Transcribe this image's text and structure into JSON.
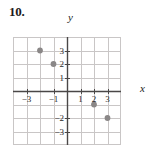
{
  "figure": {
    "problem_number": "10.",
    "x_axis_name": "x",
    "y_axis_name": "y"
  },
  "chart_data": {
    "type": "scatter",
    "title": "10.",
    "xlabel": "x",
    "ylabel": "y",
    "xlim": [
      -4,
      4
    ],
    "ylim": [
      -4,
      4
    ],
    "grid": true,
    "legend": null,
    "axis_color": "#4a4747",
    "grid_color": "#c9c6c6",
    "point_color": "#8a8787",
    "x_ticks": [
      -3,
      -1,
      1,
      2,
      3
    ],
    "x_tick_labels": [
      "-3",
      "-1",
      "1",
      "2",
      "3"
    ],
    "y_ticks": [
      3,
      2,
      1,
      -2,
      -3
    ],
    "y_tick_labels": [
      "3",
      "2",
      "1",
      "-2",
      "-3"
    ],
    "points": [
      {
        "x": -2,
        "y": 3,
        "label": "(-2, 3)"
      },
      {
        "x": -1,
        "y": 2,
        "label": "(-1, 2)"
      },
      {
        "x": 2,
        "y": -1,
        "label": "(2, -1)"
      },
      {
        "x": 3,
        "y": -2,
        "label": "(3, -2)"
      }
    ]
  }
}
